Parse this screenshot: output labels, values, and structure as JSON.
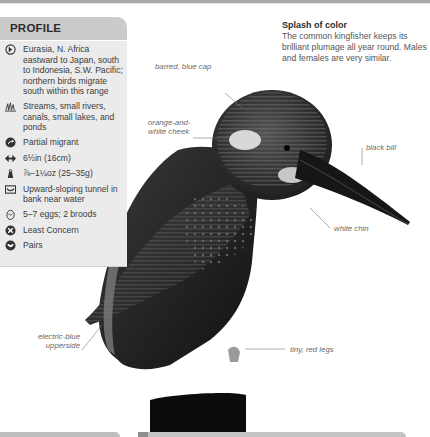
{
  "profile": {
    "title": "PROFILE",
    "items": [
      {
        "icon": "globe-range-icon",
        "text": "Eurasia, N. Africa eastward to Japan, south to Indonesia, S.W. Pacific; northern birds migrate south within this range"
      },
      {
        "icon": "habitat-grass-icon",
        "text": "Streams, small rivers, canals, small lakes, and ponds"
      },
      {
        "icon": "migration-arrow-icon",
        "text": "Partial migrant"
      },
      {
        "icon": "length-arrows-icon",
        "text": "6½in (16cm)"
      },
      {
        "icon": "weight-icon",
        "text": "⅞–1¼oz (25–35g)"
      },
      {
        "icon": "nest-icon",
        "text": "Upward-sloping tunnel in bank near water"
      },
      {
        "icon": "egg-icon",
        "text": "5–7 eggs; 2 broods"
      },
      {
        "icon": "conservation-status-icon",
        "text": "Least Concern"
      },
      {
        "icon": "social-pairs-icon",
        "text": "Pairs"
      }
    ]
  },
  "intro": {
    "title": "Splash of color",
    "body": "The common kingfisher keeps its brilliant plumage all year round. Males and females are very similar."
  },
  "annotations": {
    "cap": "barred, blue cap",
    "cheek": "orange-and-white cheek",
    "bill": "black bill",
    "chin": "white chin",
    "upperside": "electric-blue upperside",
    "legs": "tiny, red legs"
  }
}
